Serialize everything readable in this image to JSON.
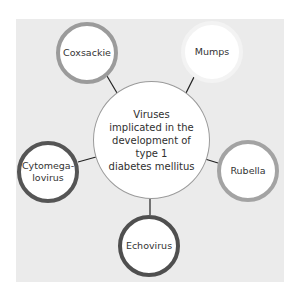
{
  "diagram": {
    "type": "hub-and-spoke",
    "center": {
      "label": "Viruses\nimplicated in the\ndevelopment of\ntype 1\ndiabetes mellitus"
    },
    "nodes": [
      {
        "id": "coxsackie",
        "label": "Coxsackie",
        "border_color": "#9b9b9b"
      },
      {
        "id": "mumps",
        "label": "Mumps",
        "border_color": "#f3f3f3"
      },
      {
        "id": "rubella",
        "label": "Rubella",
        "border_color": "#a3a3a3"
      },
      {
        "id": "echovirus",
        "label": "Echovirus",
        "border_color": "#4f4f4f"
      },
      {
        "id": "cytomegalovirus",
        "label": "Cytomega-\nlovirus",
        "border_color": "#555555"
      }
    ],
    "colors": {
      "panel_background": "#ebebeb",
      "node_fill": "#ffffff",
      "connector": "#222222"
    }
  }
}
